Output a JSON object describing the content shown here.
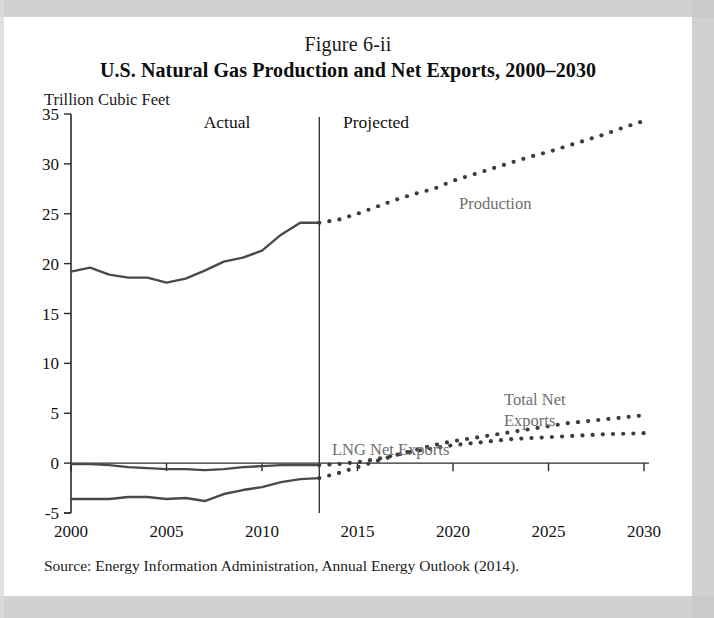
{
  "figure": {
    "number": "Figure 6-ii",
    "title": "U.S. Natural Gas Production and Net Exports, 2000–2030",
    "unit_label": "Trillion Cubic Feet",
    "source": "Source: Energy Information Administration, Annual Energy Outlook (2014)."
  },
  "annotations": {
    "actual": "Actual",
    "projected": "Projected",
    "production": "Production",
    "lng_net_exports": "LNG Net Exports",
    "total_net_exports_line1": "Total Net",
    "total_net_exports_line2": "Exports"
  },
  "colors": {
    "actual_line": "#4a4a4a",
    "projected_dots": "#3c3c3c",
    "axis": "#2b2b2b",
    "label_gray": "#6e6e6e",
    "paper": "#ffffff",
    "scan_margin": "#c9c9c9"
  },
  "chart_data": {
    "type": "line",
    "title": "U.S. Natural Gas Production and Net Exports, 2000–2030",
    "xlabel": "",
    "ylabel": "Trillion Cubic Feet",
    "xlim": [
      2000,
      2030
    ],
    "ylim": [
      -5,
      35
    ],
    "yticks": [
      -5,
      0,
      5,
      10,
      15,
      20,
      25,
      30,
      35
    ],
    "xticks": [
      2000,
      2005,
      2010,
      2015,
      2020,
      2025,
      2030
    ],
    "grid": false,
    "legend": "inline-annotations",
    "divider_year": 2013,
    "divider_labels": [
      "Actual",
      "Projected"
    ],
    "x": [
      2000,
      2001,
      2002,
      2003,
      2004,
      2005,
      2006,
      2007,
      2008,
      2009,
      2010,
      2011,
      2012,
      2013,
      2014,
      2015,
      2016,
      2017,
      2018,
      2019,
      2020,
      2021,
      2022,
      2023,
      2024,
      2025,
      2026,
      2027,
      2028,
      2029,
      2030
    ],
    "series": [
      {
        "name": "Production",
        "style_actual": "solid",
        "style_projected": "dotted",
        "values": [
          19.2,
          19.6,
          18.9,
          18.6,
          18.6,
          18.1,
          18.5,
          19.3,
          20.2,
          20.6,
          21.3,
          22.9,
          24.1,
          24.1,
          24.4,
          25.0,
          25.7,
          26.4,
          27.0,
          27.5,
          28.3,
          28.9,
          29.5,
          30.1,
          30.7,
          31.2,
          31.8,
          32.4,
          33.0,
          33.7,
          34.3
        ]
      },
      {
        "name": "Total Net Exports",
        "style_actual": "solid",
        "style_projected": "dotted",
        "values": [
          -3.6,
          -3.6,
          -3.6,
          -3.4,
          -3.4,
          -3.6,
          -3.5,
          -3.8,
          -3.1,
          -2.7,
          -2.4,
          -1.9,
          -1.6,
          -1.5,
          -1.0,
          -0.4,
          0.2,
          0.8,
          1.3,
          1.8,
          2.2,
          2.5,
          2.8,
          3.1,
          3.4,
          3.7,
          4.0,
          4.2,
          4.4,
          4.6,
          4.8
        ]
      },
      {
        "name": "LNG Net Exports",
        "style_actual": "solid",
        "style_projected": "dotted",
        "values": [
          -0.1,
          -0.1,
          -0.2,
          -0.4,
          -0.5,
          -0.6,
          -0.6,
          -0.7,
          -0.6,
          -0.4,
          -0.3,
          -0.2,
          -0.2,
          -0.2,
          -0.1,
          0.1,
          0.4,
          0.8,
          1.2,
          1.5,
          1.8,
          2.0,
          2.2,
          2.4,
          2.5,
          2.6,
          2.7,
          2.8,
          2.9,
          2.95,
          3.0
        ]
      }
    ]
  }
}
